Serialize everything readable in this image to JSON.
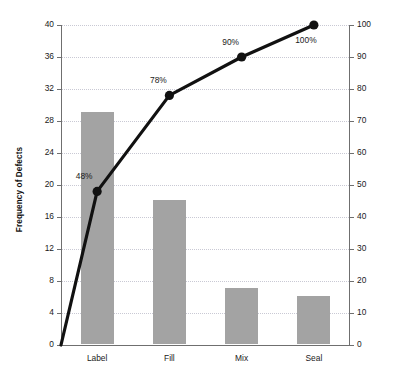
{
  "chart_data": {
    "type": "bar",
    "title": "",
    "subtitle": "",
    "categories": [
      "Label",
      "Fill",
      "Mix",
      "Seal"
    ],
    "values": [
      29,
      18,
      7,
      6
    ],
    "xlabel": "",
    "ylabel": "Frequency of Defects",
    "ylim": [
      0,
      40
    ],
    "y_ticks": [
      0,
      4,
      8,
      12,
      16,
      20,
      24,
      28,
      32,
      36,
      40
    ],
    "y2label": "Cumulative Percentage of Defects",
    "y2lim": [
      0,
      100
    ],
    "y2_ticks": [
      0,
      10,
      20,
      30,
      40,
      50,
      60,
      70,
      80,
      90,
      100
    ],
    "grid": true,
    "legend": "none",
    "series": [
      {
        "name": "Frequency of Defects",
        "type": "bar",
        "axis": "left",
        "values": [
          29,
          18,
          7,
          6
        ],
        "color": "#a3a3a3"
      },
      {
        "name": "Cumulative Percentage of Defects",
        "type": "line",
        "axis": "right",
        "start_value": 0,
        "values": [
          48,
          78,
          90,
          100
        ],
        "point_labels": [
          "48%",
          "78%",
          "90%",
          "100%"
        ],
        "color": "#111111"
      }
    ],
    "annotations": [
      "48%",
      "78%",
      "90%",
      "100%"
    ]
  },
  "axes": {
    "left_title": "Frequency of Defects",
    "right_title": "Cumulative Percentage of Defects",
    "left_ticks": [
      "0",
      "4",
      "8",
      "12",
      "16",
      "20",
      "24",
      "28",
      "32",
      "36",
      "40"
    ],
    "right_ticks": [
      "0",
      "10",
      "20",
      "30",
      "40",
      "50",
      "60",
      "70",
      "80",
      "90",
      "100"
    ],
    "categories": [
      "Label",
      "Fill",
      "Mix",
      "Seal"
    ]
  },
  "labels": {
    "p0": "48%",
    "p1": "78%",
    "p2": "90%",
    "p3": "100%"
  },
  "colors": {
    "bar": "#a3a3a3",
    "line": "#111111",
    "grid": "#c9c9d4",
    "axis": "#6f6f6f",
    "text": "#1a1a1a",
    "background": "#ffffff"
  }
}
